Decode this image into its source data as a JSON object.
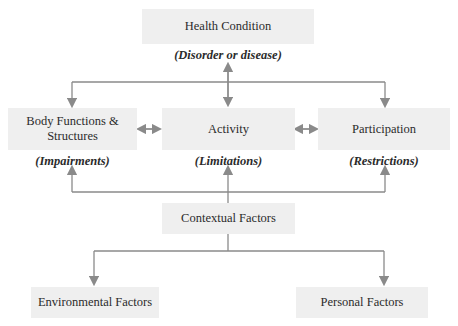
{
  "diagram": {
    "type": "ICF model flow diagram",
    "nodes": {
      "health_condition": {
        "label": "Health Condition",
        "sublabel": "(Disorder or disease)"
      },
      "body_functions": {
        "label": "Body Functions & Structures",
        "sublabel": "(Impairments)"
      },
      "activity": {
        "label": "Activity",
        "sublabel": "(Limitations)"
      },
      "participation": {
        "label": "Participation",
        "sublabel": "(Restrictions)"
      },
      "contextual": {
        "label": "Contextual Factors"
      },
      "environmental": {
        "label": "Environmental Factors"
      },
      "personal": {
        "label": "Personal Factors"
      }
    },
    "edges": [
      {
        "from": "health_condition",
        "to": "activity",
        "type": "bidirectional"
      },
      {
        "from": "health_condition",
        "to": "body_functions",
        "type": "directed"
      },
      {
        "from": "health_condition",
        "to": "participation",
        "type": "directed"
      },
      {
        "from": "body_functions",
        "to": "activity",
        "type": "bidirectional"
      },
      {
        "from": "activity",
        "to": "participation",
        "type": "bidirectional"
      },
      {
        "from": "contextual",
        "to": "body_functions",
        "type": "directed"
      },
      {
        "from": "contextual",
        "to": "activity",
        "type": "directed"
      },
      {
        "from": "contextual",
        "to": "participation",
        "type": "directed"
      },
      {
        "from": "contextual",
        "to": "environmental",
        "type": "directed"
      },
      {
        "from": "contextual",
        "to": "personal",
        "type": "directed"
      }
    ],
    "colors": {
      "box_fill": "#efefef",
      "line": "#8a8a8a",
      "text": "#2b2b2b"
    }
  }
}
